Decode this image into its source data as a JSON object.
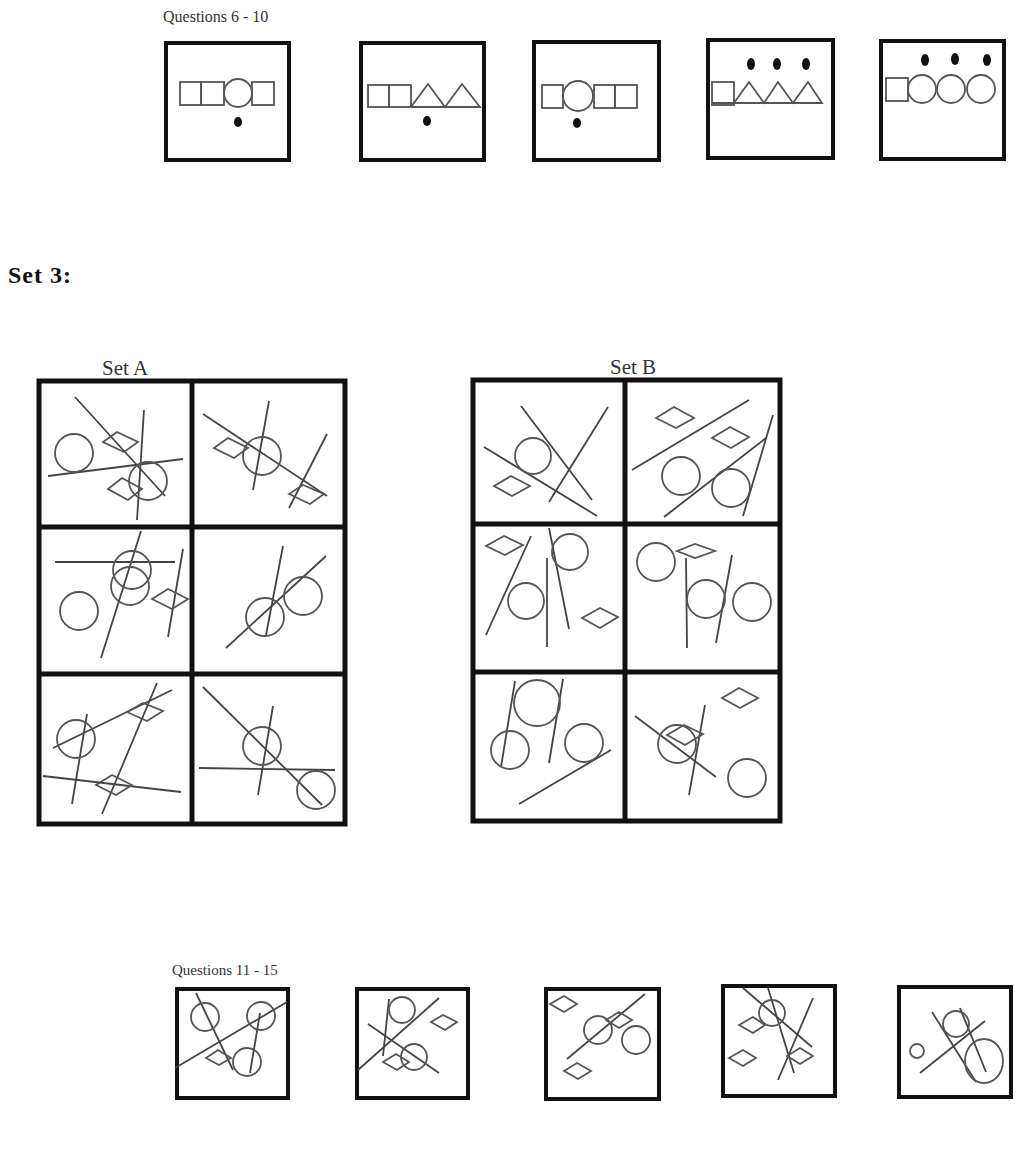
{
  "section1": {
    "label": "Questions 6 - 10",
    "items": [
      {
        "id": "q6",
        "shapes": [
          "square",
          "square",
          "circle",
          "square"
        ],
        "dots_below": 1
      },
      {
        "id": "q7",
        "shapes": [
          "square",
          "square",
          "triangle",
          "triangle"
        ],
        "dots_below": 1
      },
      {
        "id": "q8",
        "shapes": [
          "square",
          "circle",
          "square",
          "square"
        ],
        "dots_below": 1
      },
      {
        "id": "q9",
        "shapes": [
          "square",
          "triangle",
          "triangle",
          "triangle"
        ],
        "dots_above": 3
      },
      {
        "id": "q10",
        "shapes": [
          "square",
          "circle",
          "circle",
          "circle"
        ],
        "dots_above": 3
      }
    ]
  },
  "section2": {
    "heading": "Set 3:",
    "set_a": {
      "label": "Set A",
      "panels": 6
    },
    "set_b": {
      "label": "Set B",
      "panels": 6
    }
  },
  "section3": {
    "label": "Questions 11 - 15",
    "items": [
      {
        "id": "q11"
      },
      {
        "id": "q12"
      },
      {
        "id": "q13"
      },
      {
        "id": "q14"
      },
      {
        "id": "q15"
      }
    ]
  }
}
